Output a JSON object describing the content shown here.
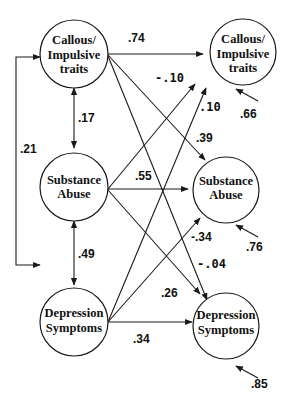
{
  "nodes": {
    "time1": {
      "callous": {
        "line1": "Callous/",
        "line2": "Impulsive",
        "line3": "traits"
      },
      "substance": {
        "line1": "Substance",
        "line2": "Abuse"
      },
      "depression": {
        "line1": "Depression",
        "line2": "Symptoms"
      }
    },
    "time2": {
      "callous": {
        "line1": "Callous/",
        "line2": "Impulsive",
        "line3": "traits"
      },
      "substance": {
        "line1": "Substance",
        "line2": "Abuse"
      },
      "depression": {
        "line1": "Depression",
        "line2": "Symptoms"
      }
    }
  },
  "correlations": {
    "callous_substance": ".17",
    "substance_depression": ".49",
    "callous_depression": ".21"
  },
  "paths": {
    "callous_to_callous": ".74",
    "substance_to_callous": "-.10",
    "depression_to_callous": ".10",
    "callous_to_substance": ".39",
    "substance_to_substance": ".55",
    "depression_to_substance": "-.34",
    "callous_to_depression": "-.04",
    "substance_to_depression": ".26",
    "depression_to_depression": ".34"
  },
  "residuals": {
    "callous": ".66",
    "substance": ".76",
    "depression": ".85"
  }
}
